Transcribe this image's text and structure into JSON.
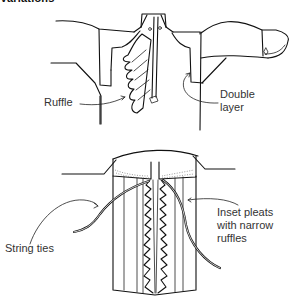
{
  "heading": "Variations",
  "figures": [
    {
      "name": "shirt-front-ruffle",
      "labels": {
        "ruffle": "Ruffle",
        "double_layer_line1": "Double",
        "double_layer_line2": "layer"
      }
    },
    {
      "name": "inset-pleats-front",
      "labels": {
        "string_ties": "String ties",
        "inset_pleats_line1": "Inset pleats",
        "inset_pleats_line2": "with narrow",
        "inset_pleats_line3": "ruffles"
      }
    }
  ],
  "colors": {
    "line": "#111111",
    "label_text": "#333333",
    "background": "#ffffff"
  }
}
